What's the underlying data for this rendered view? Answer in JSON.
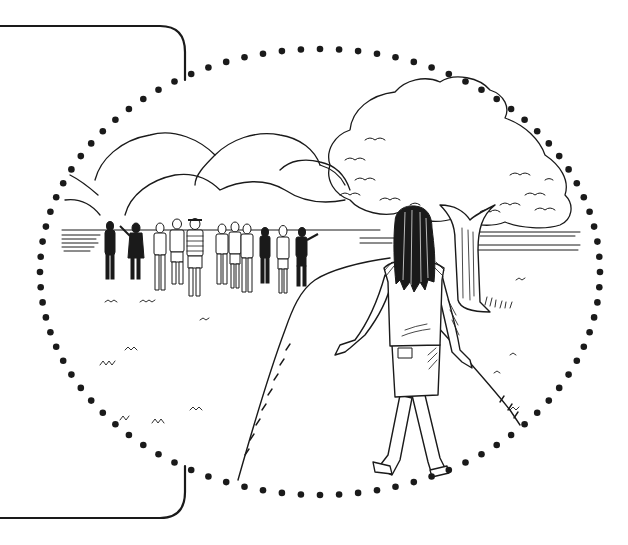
{
  "illustration": {
    "description": "Black-and-white line drawing: a long-haired girl seen from behind walking along a park path toward a group of people standing near a lake, framed by a dotted oval vignette with a rounded bracket on the left.",
    "colors": {
      "ink": "#1a1a1a",
      "background": "#ffffff"
    },
    "frame": {
      "bracket_side": "left",
      "bracket_top_y": 26,
      "bracket_bottom_y": 518,
      "bracket_right_x": 185
    },
    "vignette": {
      "shape": "dotted-ellipse",
      "center_x": 320,
      "center_y": 272,
      "radius_x": 280,
      "radius_y": 223,
      "dot_count": 92
    },
    "elements": [
      "girl-walking",
      "group-of-people",
      "park-path",
      "large-tree",
      "background-bushes",
      "lake-horizon",
      "grass-tufts"
    ],
    "people_count": 13
  }
}
